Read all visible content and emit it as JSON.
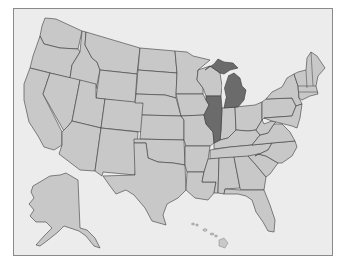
{
  "map": {
    "title": "United States",
    "colors": {
      "background": "#ececec",
      "border": "#8a8a8a",
      "state_default": "#c8c8c8",
      "state_highlight": "#6b6b6b",
      "stroke": "#3a3a3a"
    },
    "highlighted_states": [
      "Michigan",
      "Illinois"
    ],
    "states": [
      {
        "name": "Washington",
        "highlight": false
      },
      {
        "name": "Oregon",
        "highlight": false
      },
      {
        "name": "California",
        "highlight": false
      },
      {
        "name": "Idaho",
        "highlight": false
      },
      {
        "name": "Nevada",
        "highlight": false
      },
      {
        "name": "Montana",
        "highlight": false
      },
      {
        "name": "Wyoming",
        "highlight": false
      },
      {
        "name": "Utah",
        "highlight": false
      },
      {
        "name": "Arizona",
        "highlight": false
      },
      {
        "name": "Colorado",
        "highlight": false
      },
      {
        "name": "New Mexico",
        "highlight": false
      },
      {
        "name": "North Dakota",
        "highlight": false
      },
      {
        "name": "South Dakota",
        "highlight": false
      },
      {
        "name": "Nebraska",
        "highlight": false
      },
      {
        "name": "Kansas",
        "highlight": false
      },
      {
        "name": "Oklahoma",
        "highlight": false
      },
      {
        "name": "Texas",
        "highlight": false
      },
      {
        "name": "Minnesota",
        "highlight": false
      },
      {
        "name": "Iowa",
        "highlight": false
      },
      {
        "name": "Missouri",
        "highlight": false
      },
      {
        "name": "Arkansas",
        "highlight": false
      },
      {
        "name": "Louisiana",
        "highlight": false
      },
      {
        "name": "Wisconsin",
        "highlight": false
      },
      {
        "name": "Illinois",
        "highlight": true
      },
      {
        "name": "Michigan",
        "highlight": true
      },
      {
        "name": "Indiana",
        "highlight": false
      },
      {
        "name": "Ohio",
        "highlight": false
      },
      {
        "name": "Kentucky",
        "highlight": false
      },
      {
        "name": "Tennessee",
        "highlight": false
      },
      {
        "name": "Mississippi",
        "highlight": false
      },
      {
        "name": "Alabama",
        "highlight": false
      },
      {
        "name": "Georgia",
        "highlight": false
      },
      {
        "name": "Florida",
        "highlight": false
      },
      {
        "name": "South Carolina",
        "highlight": false
      },
      {
        "name": "North Carolina",
        "highlight": false
      },
      {
        "name": "Virginia",
        "highlight": false
      },
      {
        "name": "West Virginia",
        "highlight": false
      },
      {
        "name": "Pennsylvania",
        "highlight": false
      },
      {
        "name": "New York",
        "highlight": false
      },
      {
        "name": "New England",
        "highlight": false
      },
      {
        "name": "Mid-Atlantic",
        "highlight": false
      },
      {
        "name": "Alaska",
        "highlight": false
      },
      {
        "name": "Hawaii",
        "highlight": false
      }
    ]
  }
}
